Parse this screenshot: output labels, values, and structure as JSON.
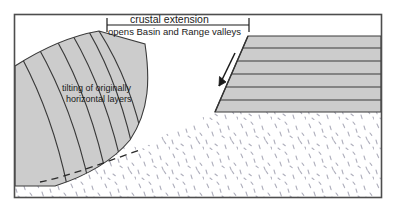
{
  "figure": {
    "type": "geologic-cross-section",
    "caption_title": "crustal extension",
    "caption_subtitle": "opens Basin and Range valleys",
    "annotation_line_1": "tilting of originally",
    "annotation_line_2": "horizontal layers",
    "colors": {
      "frame": "#4d4d4d",
      "layer_fill": "#cccccc",
      "layer_line": "#3a3a3a",
      "stipple": "#b9b9c4",
      "background": "#ffffff",
      "text": "#1a1a1a",
      "fault_line": "#333333"
    },
    "elements": {
      "extension_bracket": "horizontal span bar with end ticks marking the extended region",
      "tilted_block": "rotated fault block with inclined strata on the left",
      "horizontal_block": "undisturbed flat-lying strata on the right",
      "fault_scarp": "normal fault surface separating the two blocks",
      "fault_arrow": "down-dip slip arrow on the fault plane",
      "listric_fault": "dashed curved detachment fault at depth",
      "basement": "stippled undifferentiated basement rock"
    },
    "geometry": {
      "frame": {
        "x": 14,
        "y": 14,
        "width": 368,
        "height": 184
      },
      "bracket": {
        "x1": 107,
        "x2": 249,
        "y": 25
      },
      "tilted_block_layers": 6,
      "horizontal_block_layers": 6,
      "horizontal_block_top": 36,
      "horizontal_block_bottom": 112
    }
  }
}
